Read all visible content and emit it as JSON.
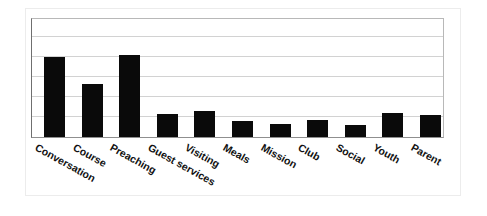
{
  "chart_data": {
    "type": "bar",
    "title": "",
    "subtitle": "",
    "xlabel": "",
    "ylabel": "",
    "grid": true,
    "legend": false,
    "legend_position": "none",
    "axis_tick_labels_visible": false,
    "ylim": [
      0,
      6
    ],
    "y_gridline_values": [
      1,
      2,
      3,
      4,
      5
    ],
    "bar_color": "#0a0a0a",
    "categories": [
      "Conversation",
      "Course",
      "Preaching",
      "Guest services",
      "Visiting",
      "Meals",
      "Mission",
      "Club",
      "Social",
      "Youth",
      "Parent"
    ],
    "values": [
      4.0,
      2.65,
      4.1,
      1.15,
      1.3,
      0.8,
      0.65,
      0.85,
      0.6,
      1.2,
      1.1
    ],
    "annotations": []
  },
  "chart": {
    "bars": [
      {
        "label": "Conversation",
        "value": 4.0
      },
      {
        "label": "Course",
        "value": 2.65
      },
      {
        "label": "Preaching",
        "value": 4.1
      },
      {
        "label": "Guest services",
        "value": 1.15
      },
      {
        "label": "Visiting",
        "value": 1.3
      },
      {
        "label": "Meals",
        "value": 0.8
      },
      {
        "label": "Mission",
        "value": 0.65
      },
      {
        "label": "Club",
        "value": 0.85
      },
      {
        "label": "Social",
        "value": 0.6
      },
      {
        "label": "Youth",
        "value": 1.2
      },
      {
        "label": "Parent",
        "value": 1.1
      }
    ],
    "colors": {
      "bar": "#0a0a0a",
      "gridline": "#d2d2d2",
      "axis": "#8f8f8f",
      "background": "#ffffff",
      "outer_border": "#ececec"
    }
  }
}
